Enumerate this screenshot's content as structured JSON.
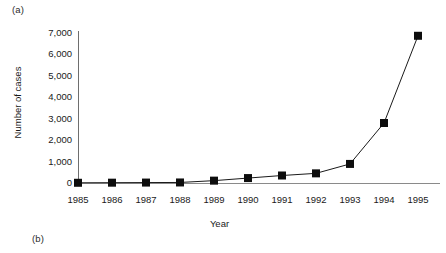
{
  "panel_labels": {
    "a": "(a)",
    "b": "(b)"
  },
  "chart_data": {
    "type": "line",
    "title": "",
    "xlabel": "Year",
    "ylabel": "Number of cases",
    "categories": [
      "1985",
      "1986",
      "1987",
      "1988",
      "1989",
      "1990",
      "1991",
      "1992",
      "1993",
      "1994",
      "1995"
    ],
    "values": [
      10,
      15,
      20,
      25,
      110,
      230,
      350,
      450,
      890,
      2800,
      6870
    ],
    "series": [
      {
        "name": "Number of cases",
        "values": [
          10,
          15,
          20,
          25,
          110,
          230,
          350,
          450,
          890,
          2800,
          6870
        ]
      }
    ],
    "ylim": [
      0,
      7000
    ],
    "ytick_values": [
      7000,
      6000,
      5000,
      4000,
      3000,
      2000,
      1000,
      0
    ],
    "ytick_labels": [
      "7,000",
      "6,000",
      "5,000",
      "4,000",
      "3,000",
      "2,000",
      "1,000",
      "0"
    ],
    "xtick_labels": [
      "1985",
      "1986",
      "1987",
      "1988",
      "1989",
      "1990",
      "1991",
      "1992",
      "1993",
      "1994",
      "1995"
    ],
    "grid": false,
    "legend": "none",
    "marker": "square",
    "marker_color": "#0d0d0d",
    "line_color": "#1a1a1a",
    "axis_color": "#7a7a7a",
    "background": "#ffffff"
  }
}
